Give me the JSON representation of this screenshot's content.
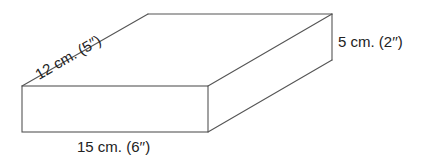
{
  "figure": {
    "type": "rectangular-box-dimensions",
    "stroke_color": "#555555",
    "text_color": "#222222",
    "labels": {
      "depth": "12 cm. (5′′)",
      "height": "5 cm. (2′′)",
      "width": "15 cm. (6′′)"
    },
    "dimensions": {
      "width": {
        "cm": 15,
        "in": 6
      },
      "depth": {
        "cm": 12,
        "in": 5
      },
      "height": {
        "cm": 5,
        "in": 2
      }
    }
  }
}
